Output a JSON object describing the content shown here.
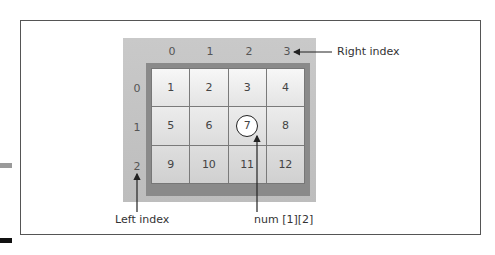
{
  "column_indices": [
    "0",
    "1",
    "2",
    "3"
  ],
  "row_indices": [
    "0",
    "1",
    "2"
  ],
  "cells": [
    [
      "1",
      "2",
      "3",
      "4"
    ],
    [
      "5",
      "6",
      "7",
      "8"
    ],
    [
      "9",
      "10",
      "11",
      "12"
    ]
  ],
  "highlighted_cell": {
    "row": 1,
    "col": 2,
    "value": "7"
  },
  "annotations": {
    "right_index": "Right index",
    "left_index": "Left index",
    "element_ref": "num [1][2]"
  },
  "colors": {
    "backdrop": "#c4c4c4",
    "grid_frame": "#8a8a8a",
    "cell_light": "#f2f2f2",
    "border": "#555555"
  }
}
